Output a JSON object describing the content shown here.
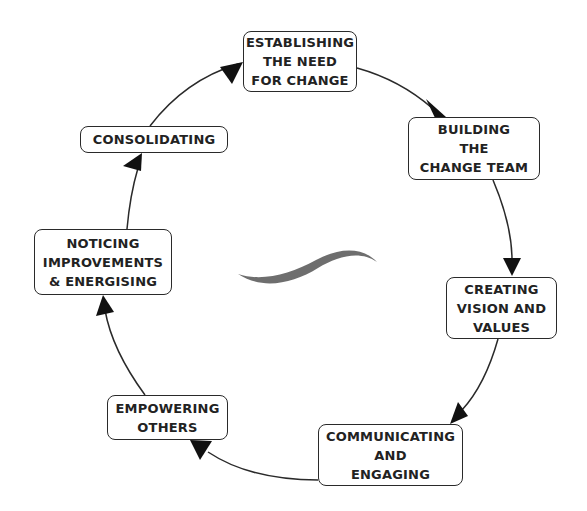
{
  "diagram": {
    "type": "cycle",
    "steps": [
      {
        "id": "establishing",
        "lines": [
          "ESTABLISHING",
          "THE NEED",
          "FOR CHANGE"
        ]
      },
      {
        "id": "building",
        "lines": [
          "BUILDING",
          "THE",
          "CHANGE TEAM"
        ]
      },
      {
        "id": "creating",
        "lines": [
          "CREATING",
          "VISION AND",
          "VALUES"
        ]
      },
      {
        "id": "communicating",
        "lines": [
          "COMMUNICATING",
          "AND",
          "ENGAGING"
        ]
      },
      {
        "id": "empowering",
        "lines": [
          "EMPOWERING",
          "OTHERS"
        ]
      },
      {
        "id": "noticing",
        "lines": [
          "NOTICING",
          "IMPROVEMENTS",
          "& ENERGISING"
        ]
      },
      {
        "id": "consolidating",
        "lines": [
          "CONSOLIDATING"
        ]
      }
    ],
    "colors": {
      "line": "#2a2a2a",
      "swoosh": "#6e6e6e",
      "box_border": "#2a2a2a"
    }
  }
}
